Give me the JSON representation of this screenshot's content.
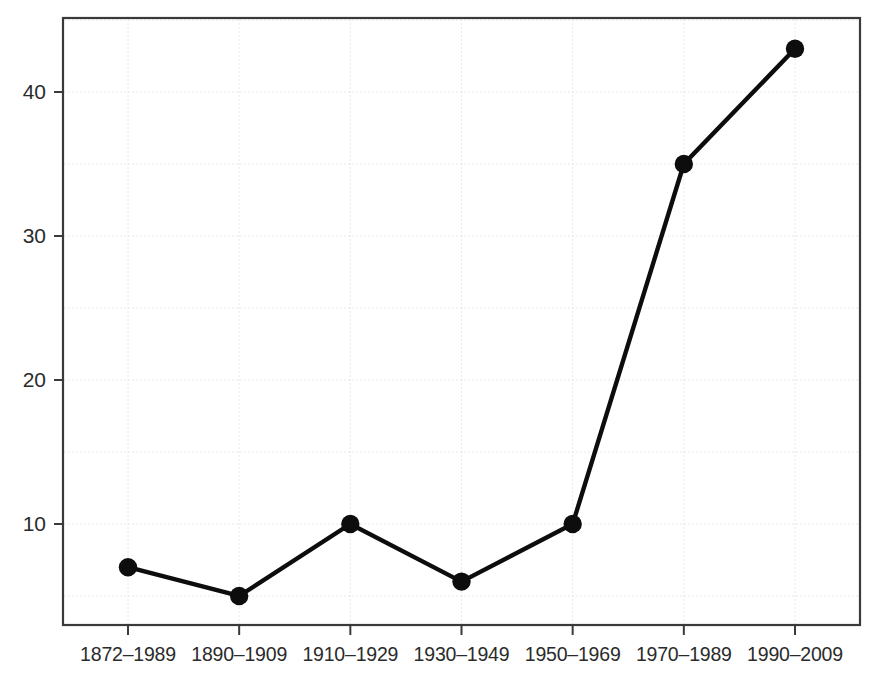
{
  "chart_data": {
    "type": "line",
    "title": "",
    "subtitle": "",
    "xlabel": "",
    "ylabel": "",
    "categories": [
      "1872–1989",
      "1890–1909",
      "1910–1929",
      "1930–1949",
      "1950–1969",
      "1970–1989",
      "1990–2009"
    ],
    "values": [
      7,
      5,
      10,
      6,
      10,
      35,
      43
    ],
    "series": [
      {
        "name": "",
        "values": [
          7,
          5,
          10,
          6,
          10,
          35,
          43
        ]
      }
    ],
    "ylim": [
      0.5,
      45.5
    ],
    "yticks": [
      10,
      20,
      30,
      40
    ],
    "ytick_labels": [
      "10",
      "20",
      "30",
      "40"
    ],
    "y_gridlines": [
      5,
      15,
      25,
      35,
      45
    ],
    "x_gridlines_at_categories": true,
    "grid": true,
    "legend": false,
    "legend_position": "none",
    "marker": "filled-circle",
    "line_color": "#0d0d0d",
    "marker_color": "#0d0d0d",
    "grid_color": "#e8e8ea",
    "axis_color": "#3a3a3a",
    "background_color": "#ffffff",
    "plot_area": {
      "left": 63,
      "top": 18,
      "right": 860,
      "bottom": 625
    }
  },
  "axes": {
    "y_tick_labels": [
      "40",
      "30",
      "20",
      "10"
    ],
    "x_tick_labels": [
      "1872–1989",
      "1890–1909",
      "1910–1929",
      "1930–1949",
      "1950–1969",
      "1970–1989",
      "1990–2009"
    ]
  }
}
